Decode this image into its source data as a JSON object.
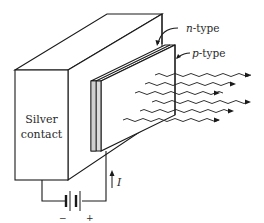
{
  "figure": {
    "labels": {
      "n_type": "n-type",
      "p_type": "p-type",
      "silver_line1": "Silver",
      "silver_line2": "contact",
      "current": "I",
      "battery_minus": "−",
      "battery_plus": "+"
    },
    "components": [
      {
        "name": "silver-contact-block",
        "label": "Silver contact"
      },
      {
        "name": "n-type-layer",
        "label": "n-type"
      },
      {
        "name": "p-type-layer",
        "label": "p-type"
      },
      {
        "name": "battery",
        "polarity": [
          "−",
          "+"
        ]
      },
      {
        "name": "current-arrow",
        "label": "I"
      },
      {
        "name": "emitted-light-waves",
        "count": 6
      }
    ],
    "colors": {
      "line": "#1a1a1a",
      "shading": "#dcdcdc",
      "background": "#ffffff"
    }
  }
}
